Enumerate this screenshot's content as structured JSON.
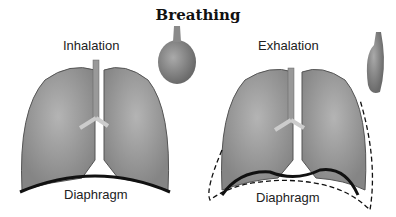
{
  "title": "Breathing",
  "panels": [
    {
      "label": "Inhalation",
      "diaphragm_label": "Diaphragm",
      "balloon": "inflated"
    },
    {
      "label": "Exhalation",
      "diaphragm_label": "Diaphragm",
      "balloon": "deflated"
    }
  ]
}
